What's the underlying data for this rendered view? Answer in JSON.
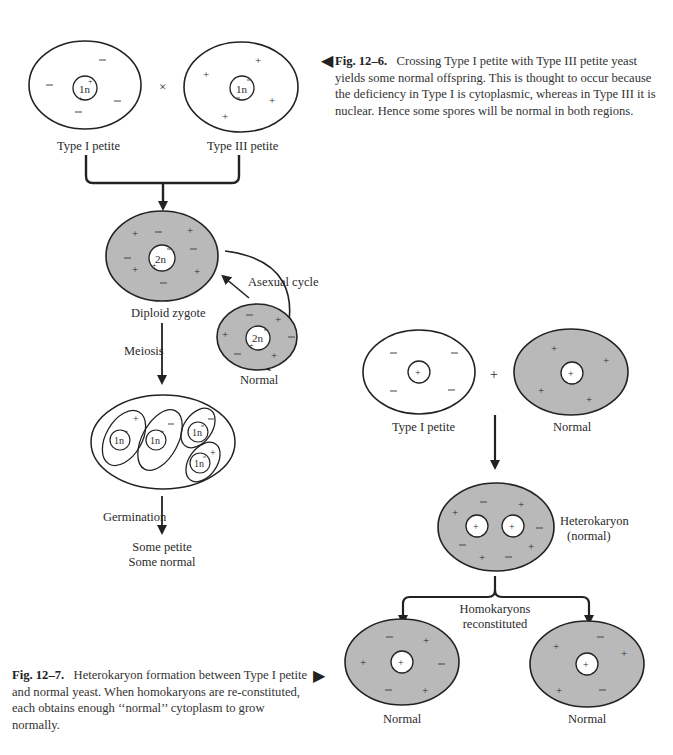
{
  "figure_12_6": {
    "caption_label": "Fig. 12–6.",
    "caption_text": "Crossing Type I petite with Type III petite yeast yields some normal offspring. This is thought to occur because the deficiency in Type I is cytoplasmic, whereas in Type III it is nuclear. Hence some spores will be normal in both regions.",
    "pointer": "◀",
    "cells": {
      "type1": {
        "label": "Type I petite",
        "nucleus": "1n",
        "cytoplasm": "white"
      },
      "type3": {
        "label": "Type III petite",
        "nucleus": "1n",
        "cytoplasm": "white"
      },
      "cross_symbol": "×",
      "zygote": {
        "label": "Diploid zygote",
        "nucleus": "2n",
        "cytoplasm": "gray"
      },
      "normal": {
        "label": "Normal",
        "nucleus": "2n",
        "cytoplasm": "gray"
      },
      "ascus_spores": [
        "1n",
        "1n",
        "1n",
        "1n"
      ]
    },
    "arrows": {
      "asexual": "Asexual cycle",
      "meiosis": "Meiosis",
      "germination": "Germination"
    },
    "outcome": [
      "Some petite",
      "Some normal"
    ]
  },
  "figure_12_7": {
    "caption_label": "Fig. 12–7.",
    "caption_text": "Heterokaryon formation between Type I petite and normal yeast. When homokaryons are reconstituted, each obtains enough “normal” cytoplasm to grow normally.",
    "caption_text_display": "Heterokaryon formation between Type I petite and normal yeast. When homokaryons are re-constituted, each obtains enough ‘‘normal’’ cytoplasm to grow normally.",
    "pointer": "▶",
    "cells": {
      "type1": {
        "label": "Type I petite",
        "nucleus": "+"
      },
      "plus_symbol": "+",
      "normal": {
        "label": "Normal",
        "nucleus": "+"
      },
      "heterokaryon": {
        "label_line1": "Heterokaryon",
        "label_line2": "(normal)"
      },
      "result_left": {
        "label": "Normal"
      },
      "result_right": {
        "label": "Normal"
      }
    },
    "arrows": {
      "split_label_line1": "Homokaryons",
      "split_label_line2": "reconstituted"
    }
  },
  "colors": {
    "ink": "#2a2a2a",
    "gray_cytoplasm": "#b9b9b9",
    "white_cytoplasm": "#ffffff"
  }
}
